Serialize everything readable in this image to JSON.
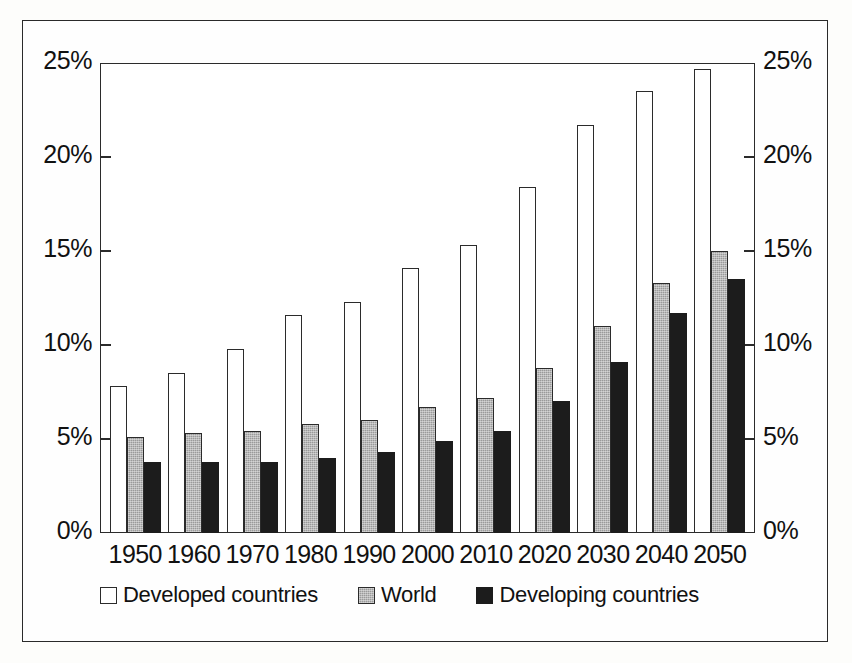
{
  "chart_data": {
    "type": "bar",
    "title": "",
    "subtitle": "",
    "xlabel": "",
    "ylabel": "",
    "ylim": [
      0,
      25
    ],
    "y_unit": "%",
    "y_ticks": [
      "0%",
      "5%",
      "10%",
      "15%",
      "20%",
      "25%"
    ],
    "y_tick_values": [
      0,
      5,
      10,
      15,
      20,
      25
    ],
    "grid": false,
    "dual_y_axis": true,
    "legend_position": "bottom",
    "categories": [
      "1950",
      "1960",
      "1970",
      "1980",
      "1990",
      "2000",
      "2010",
      "2020",
      "2030",
      "2040",
      "2050"
    ],
    "series": [
      {
        "name": "Developed countries",
        "color": "#ffffff",
        "values": [
          7.8,
          8.5,
          9.8,
          11.6,
          12.3,
          14.1,
          15.3,
          18.4,
          21.7,
          23.5,
          24.7
        ]
      },
      {
        "name": "World",
        "color": "#9a9a9a",
        "values": [
          5.1,
          5.3,
          5.4,
          5.8,
          6.0,
          6.7,
          7.2,
          8.8,
          11.0,
          13.3,
          15.0
        ]
      },
      {
        "name": "Developing countries",
        "color": "#1c1c1c",
        "values": [
          3.8,
          3.8,
          3.8,
          4.0,
          4.3,
          4.9,
          5.4,
          7.0,
          9.1,
          11.7,
          13.5
        ]
      }
    ]
  },
  "axes": {
    "left_ticks": [
      "25%",
      "20%",
      "15%",
      "10%",
      "5%",
      "0%"
    ],
    "right_ticks": [
      "25%",
      "20%",
      "15%",
      "10%",
      "5%",
      "0%"
    ]
  },
  "legend": {
    "items": [
      {
        "label": "Developed countries",
        "style": "developed"
      },
      {
        "label": "World",
        "style": "world"
      },
      {
        "label": "Developing countries",
        "style": "developing"
      }
    ]
  }
}
